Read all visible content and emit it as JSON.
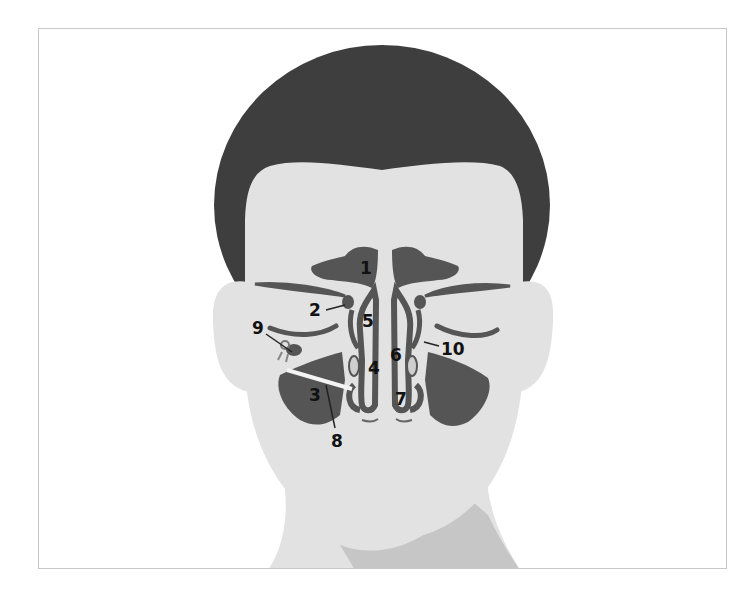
{
  "diagram": {
    "colors": {
      "hair": "#3e3e3e",
      "skin": "#e2e2e2",
      "neck_shadow": "#c6c6c6",
      "sinus": "#555555",
      "background": "#ffffff",
      "frame": "#c8c8c8"
    },
    "labels": [
      {
        "id": "1",
        "text": "1"
      },
      {
        "id": "2",
        "text": "2"
      },
      {
        "id": "3",
        "text": "3"
      },
      {
        "id": "4",
        "text": "4"
      },
      {
        "id": "5",
        "text": "5"
      },
      {
        "id": "6",
        "text": "6"
      },
      {
        "id": "7",
        "text": "7"
      },
      {
        "id": "8",
        "text": "8"
      },
      {
        "id": "9",
        "text": "9"
      },
      {
        "id": "10",
        "text": "10"
      }
    ]
  }
}
